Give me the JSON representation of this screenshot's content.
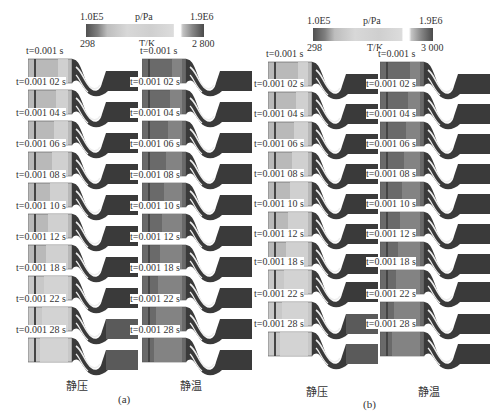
{
  "figure": {
    "panel_a": {
      "label": "(a)",
      "colorbar_pressure": {
        "title": "p/Pa",
        "min": "1.0E5",
        "max": "1.9E6"
      },
      "colorbar_temperature": {
        "title": "T/K",
        "min": "298",
        "max": "2 800"
      },
      "column_left_caption": "静压",
      "column_right_caption": "静温",
      "times": [
        "t=0.001 s",
        "t=0.001 02 s",
        "t=0.001 04 s",
        "t=0.001 06 s",
        "t=0.001 08 s",
        "t=0.001 10 s",
        "t=0.001 12 s",
        "t=0.001 18 s",
        "t=0.001 22 s",
        "t=0.001 28 s"
      ]
    },
    "panel_b": {
      "label": "(b)",
      "colorbar_pressure": {
        "title": "p/Pa",
        "min": "1.0E5",
        "max": "1.9E6"
      },
      "colorbar_temperature": {
        "title": "T/K",
        "min": "298",
        "max": "3 000"
      },
      "column_left_caption": "静压",
      "column_right_caption": "静温",
      "times": [
        "t=0.001 s",
        "t=0.001 02 s",
        "t=0.001 04 s",
        "t=0.001 06 s",
        "t=0.001 08 s",
        "t=0.001 10 s",
        "t=0.001 12 s",
        "t=0.001 18 s",
        "t=0.001 22 s",
        "t=0.001 28 s"
      ]
    }
  }
}
